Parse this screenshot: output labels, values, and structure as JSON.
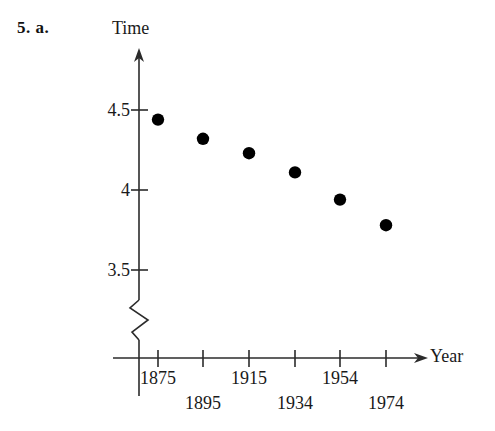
{
  "problem": {
    "number_label": "5. a."
  },
  "chart_data": {
    "type": "scatter",
    "title": "",
    "xlabel": "Year",
    "ylabel": "Time",
    "x": [
      1875,
      1895,
      1915,
      1934,
      1954,
      1974
    ],
    "values": [
      4.44,
      4.32,
      4.23,
      4.11,
      3.94,
      3.78
    ],
    "categories": [
      "1875",
      "1895",
      "1915",
      "1934",
      "1954",
      "1974"
    ],
    "series": [
      {
        "name": "Time",
        "values": [
          4.44,
          4.32,
          4.23,
          4.11,
          3.94,
          3.78
        ]
      }
    ],
    "xtick_labels": [
      "1875",
      "1895",
      "1915",
      "1934",
      "1954",
      "1974"
    ],
    "ytick_labels": [
      "4.5",
      "4",
      "3.5"
    ],
    "ytick_values": [
      4.5,
      4.0,
      3.5
    ],
    "ylim": [
      3.5,
      4.6
    ],
    "grid": false,
    "legend": false,
    "axis_break": true,
    "axis_break_axis": "y",
    "marker": "filled-circle",
    "marker_color": "#000000",
    "axis_color": "#2b2b2b",
    "background_color": "#ffffff",
    "annotations": []
  },
  "yaxis": {
    "title": "Time",
    "ticks": [
      {
        "label": "4.5",
        "value": 4.5
      },
      {
        "label": "4",
        "value": 4.0
      },
      {
        "label": "3.5",
        "value": 3.5
      }
    ]
  },
  "xaxis": {
    "title": "Year",
    "ticks": [
      {
        "label": "1875",
        "row": 0
      },
      {
        "label": "1895",
        "row": 1
      },
      {
        "label": "1915",
        "row": 0
      },
      {
        "label": "1934",
        "row": 1
      },
      {
        "label": "1954",
        "row": 0
      },
      {
        "label": "1974",
        "row": 1
      }
    ]
  },
  "points": [
    {
      "label": "1875",
      "value": 4.44
    },
    {
      "label": "1895",
      "value": 4.32
    },
    {
      "label": "1915",
      "value": 4.23
    },
    {
      "label": "1934",
      "value": 4.11
    },
    {
      "label": "1954",
      "value": 3.94
    },
    {
      "label": "1974",
      "value": 3.78
    }
  ]
}
